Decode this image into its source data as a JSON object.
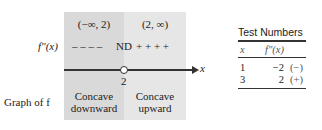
{
  "diagram": {
    "intervals": [
      "(−∞, 2)",
      "(2, ∞)"
    ],
    "row_label_derivative": "f″(x)",
    "sign_left": "– – – –",
    "sign_mid": "ND",
    "sign_right": "+ + + +",
    "axis_label": "x",
    "point_label": "2",
    "row_label_graph": "Graph of f",
    "concavity_left": [
      "Concave",
      "downward"
    ],
    "concavity_right": [
      "Concave",
      "upward"
    ],
    "colors": {
      "left_region": "#d9d9d9",
      "right_region": "#e6e6e6",
      "axis": "#333333"
    }
  },
  "test_table": {
    "title": "Test Numbers",
    "headers": [
      "x",
      "f″(x)"
    ],
    "rows": [
      {
        "x": "1",
        "value": "−2",
        "sign": "(−)"
      },
      {
        "x": "3",
        "value": "2",
        "sign": "(+)"
      }
    ]
  }
}
